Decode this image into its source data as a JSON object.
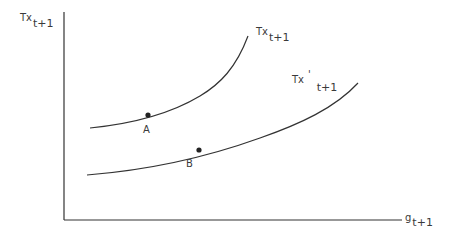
{
  "diagram": {
    "y_axis_label": {
      "main": "Tx",
      "sub": "t+1"
    },
    "x_axis_label": {
      "main": "g",
      "sub": "t+1"
    },
    "curves": [
      {
        "id": "upper",
        "label_main": "Tx",
        "label_prime": "",
        "label_sub": "t+1"
      },
      {
        "id": "lower",
        "label_main": "Tx",
        "label_prime": "'",
        "label_sub": "t+1"
      }
    ],
    "points": [
      {
        "id": "A",
        "label": "A",
        "curve": "upper"
      },
      {
        "id": "B",
        "label": "B",
        "curve": "lower"
      }
    ],
    "colors": {
      "line": "#333333",
      "background": "#ffffff"
    }
  }
}
